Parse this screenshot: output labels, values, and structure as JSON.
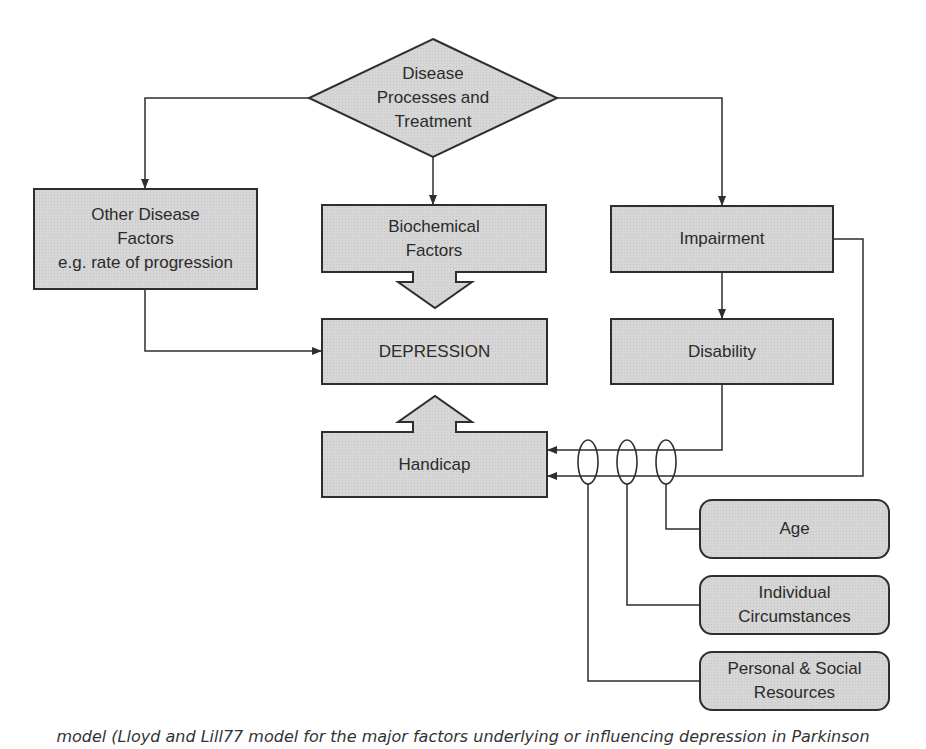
{
  "colors": {
    "background": "#ffffff",
    "box_fill": "#d3d3d3",
    "stroke": "#2e2e2e",
    "text": "#2b2b2b"
  },
  "nodes": {
    "disease_processes": {
      "shape": "diamond",
      "lines": [
        "Disease",
        "Processes and",
        "Treatment"
      ]
    },
    "other_disease_factors": {
      "shape": "rect",
      "lines": [
        "Other Disease",
        "Factors",
        "e.g. rate of progression"
      ]
    },
    "biochemical_factors": {
      "shape": "rect",
      "lines": [
        "Biochemical",
        "Factors"
      ]
    },
    "impairment": {
      "shape": "rect",
      "lines": [
        "Impairment"
      ]
    },
    "depression": {
      "shape": "rect",
      "lines": [
        "DEPRESSION"
      ]
    },
    "disability": {
      "shape": "rect",
      "lines": [
        "Disability"
      ]
    },
    "handicap": {
      "shape": "rect",
      "lines": [
        "Handicap"
      ]
    },
    "age": {
      "shape": "rounded-rect",
      "lines": [
        "Age"
      ]
    },
    "individual_circumstances": {
      "shape": "rounded-rect",
      "lines": [
        "Individual",
        "Circumstances"
      ]
    },
    "personal_social_resources": {
      "shape": "rounded-rect",
      "lines": [
        "Personal & Social",
        "Resources"
      ]
    }
  },
  "edges": [
    {
      "from": "disease_processes",
      "to": "other_disease_factors",
      "type": "arrow"
    },
    {
      "from": "disease_processes",
      "to": "biochemical_factors",
      "type": "arrow"
    },
    {
      "from": "disease_processes",
      "to": "impairment",
      "type": "arrow"
    },
    {
      "from": "other_disease_factors",
      "to": "depression",
      "type": "arrow"
    },
    {
      "from": "biochemical_factors",
      "to": "depression",
      "type": "block-arrow"
    },
    {
      "from": "impairment",
      "to": "disability",
      "type": "arrow"
    },
    {
      "from": "impairment",
      "to": "handicap",
      "type": "arrow"
    },
    {
      "from": "disability",
      "to": "handicap",
      "type": "arrow"
    },
    {
      "from": "handicap",
      "to": "depression",
      "type": "block-arrow"
    },
    {
      "from": "age",
      "to": "handicap",
      "type": "moderator"
    },
    {
      "from": "individual_circumstances",
      "to": "handicap",
      "type": "moderator"
    },
    {
      "from": "personal_social_resources",
      "to": "handicap",
      "type": "moderator"
    }
  ],
  "caption": "model (Lloyd and Lill77 model for the major factors underlying or influencing depression in Parkinson"
}
